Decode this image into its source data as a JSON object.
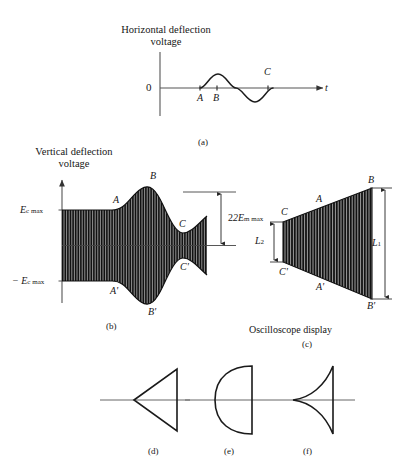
{
  "figure": {
    "background_color": "#ffffff",
    "ink_color": "#1a1a1a",
    "panel_a": {
      "axis_title": "Horizontal deflection\nvoltage",
      "origin_label": "0",
      "x_axis_label": "t",
      "tick_labels": [
        "A",
        "B",
        "C"
      ],
      "caption": "(a)",
      "waveform": "sine",
      "description": "One cycle of a sine wave on the time axis with markers A, B and C"
    },
    "panel_b": {
      "axis_title": "Vertical deflection\nvoltage",
      "upper_level_label": "E",
      "upper_level_sub": "c max",
      "lower_level_label": "− E",
      "lower_level_sub": "c max",
      "envelope_labels_upper": [
        "A",
        "B",
        "C"
      ],
      "envelope_labels_lower": [
        "A'",
        "B'",
        "C'"
      ],
      "dimension_label": "2E",
      "dimension_sub": "m max",
      "caption": "(b)",
      "description": "Amplitude-modulated carrier: flat carrier level up to A, swelling to peak B, dipping to C"
    },
    "panel_c": {
      "title": "Oscilloscope display",
      "caption": "(c)",
      "corner_labels_upper": [
        "C",
        "A",
        "B"
      ],
      "corner_labels_lower": [
        "C'",
        "A'",
        "B'"
      ],
      "dimension_small": "L",
      "dimension_small_sub": "2",
      "dimension_large": "L",
      "dimension_large_sub": "1",
      "description": "Trapezoidal pattern filled with vertical trace lines, short left edge C-C', tall right edge B-B'"
    },
    "panel_d": {
      "caption": "(d)",
      "shape": "straight-sided trapezoid",
      "description": "Linear modulation: straight sloping sides"
    },
    "panel_e": {
      "caption": "(e)",
      "shape": "convex-sided trapezoid",
      "description": "Sides bow outward indicating nonlinear modulation"
    },
    "panel_f": {
      "caption": "(f)",
      "shape": "concave-sided trapezoid",
      "description": "Sides curve inward indicating nonlinear modulation"
    }
  }
}
